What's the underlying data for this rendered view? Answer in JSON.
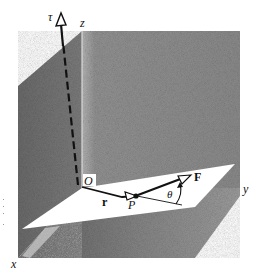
{
  "figure": {
    "type": "3D torque diagram",
    "labels": {
      "tau": "τ",
      "z_axis": "z",
      "y_axis": "y",
      "x_axis": "x",
      "origin": "O",
      "position_vector": "r",
      "point": "P",
      "force": "F",
      "angle": "θ"
    },
    "colors": {
      "left_wall": "#6e6e6e",
      "back_wall": "#8c8c8c",
      "floor": "#7a7a7a",
      "plane": "#ffffff",
      "ink": "#111111"
    }
  }
}
